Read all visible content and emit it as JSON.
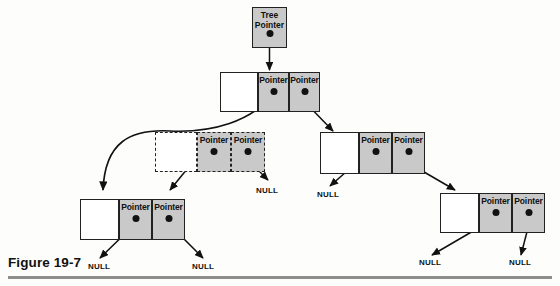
{
  "figure": {
    "caption": "Figure 19-7",
    "colors": {
      "pointer_fill": "#c9c9c9",
      "data_fill": "#ffffff",
      "stroke": "#222222",
      "rule": "#8d8d8d",
      "page_background": "#fdfdfc"
    }
  },
  "tree_pointer": {
    "line1": "Tree",
    "line2": "Pointer"
  },
  "labels": {
    "pointer": "Pointer",
    "null": "NULL"
  },
  "nodes": [
    {
      "id": "root",
      "style": "solid",
      "data_cell": "",
      "left_pointer_label": "Pointer",
      "right_pointer_label": "Pointer"
    },
    {
      "id": "left-child-detached",
      "style": "dashed",
      "data_cell": "",
      "left_pointer_label": "Pointer",
      "right_pointer_label": "Pointer"
    },
    {
      "id": "right-child",
      "style": "solid",
      "data_cell": "",
      "left_pointer_label": "Pointer",
      "right_pointer_label": "Pointer"
    },
    {
      "id": "left-grandchild",
      "style": "solid",
      "data_cell": "",
      "left_pointer_label": "Pointer",
      "right_pointer_label": "Pointer"
    },
    {
      "id": "right-grandchild",
      "style": "solid",
      "data_cell": "",
      "left_pointer_label": "Pointer",
      "right_pointer_label": "Pointer"
    }
  ],
  "null_terminals": [
    {
      "id": "null-detached-right",
      "text": "NULL"
    },
    {
      "id": "null-right-child-left",
      "text": "NULL"
    },
    {
      "id": "null-left-grandchild-left",
      "text": "NULL"
    },
    {
      "id": "null-left-grandchild-right",
      "text": "NULL"
    },
    {
      "id": "null-right-grandchild-left",
      "text": "NULL"
    },
    {
      "id": "null-right-grandchild-right",
      "text": "NULL"
    }
  ]
}
